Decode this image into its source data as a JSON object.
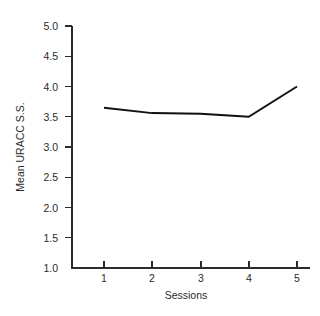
{
  "chart_data": {
    "type": "line",
    "title": "",
    "subtitle": "",
    "xlabel": "Sessions",
    "ylabel": "Mean URACC S.S.",
    "x": [
      1,
      2,
      3,
      4,
      5
    ],
    "categories": [
      "1",
      "2",
      "3",
      "4",
      "5"
    ],
    "values": [
      3.65,
      3.56,
      3.55,
      3.5,
      4.0
    ],
    "series": [
      {
        "name": "Mean URACC S.S.",
        "values": [
          3.65,
          3.56,
          3.55,
          3.5,
          4.0
        ]
      }
    ],
    "xlim": [
      0.5,
      5.5
    ],
    "ylim": [
      1.0,
      5.0
    ],
    "xticks": [
      "1",
      "2",
      "3",
      "4",
      "5"
    ],
    "yticks": [
      "1.0",
      "1.5",
      "2.0",
      "2.5",
      "3.0",
      "3.5",
      "4.0",
      "4.5",
      "5.0"
    ],
    "ytick_values": [
      1.0,
      1.5,
      2.0,
      2.5,
      3.0,
      3.5,
      4.0,
      4.5,
      5.0
    ],
    "grid": false,
    "legend": "none",
    "line_color": "#101010",
    "axis_color": "#2b2b2b",
    "background_color": "#ffffff",
    "markers": false,
    "spines": [
      "left",
      "bottom"
    ]
  },
  "axis": {
    "y_tick_labels": [
      "5.0",
      "4.5",
      "4.0",
      "3.5",
      "3.0",
      "2.5",
      "2.0",
      "1.5",
      "1.0"
    ],
    "x_tick_labels": [
      "1",
      "2",
      "3",
      "4",
      "5"
    ],
    "x_title": "Sessions",
    "y_title": "Mean URACC S.S."
  }
}
